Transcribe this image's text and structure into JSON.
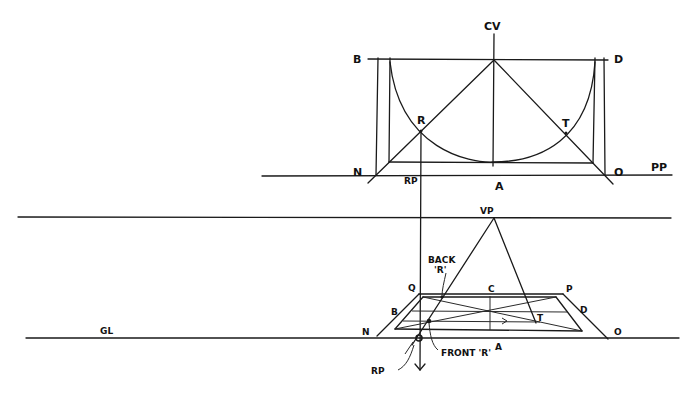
{
  "diagram": {
    "plan_view": {
      "labels": {
        "cv": "CV",
        "b": "B",
        "d": "D",
        "r": "R",
        "t": "T",
        "n": "N",
        "o": "O",
        "a": "A",
        "rp": "RP",
        "pp": "PP"
      }
    },
    "perspective_view": {
      "labels": {
        "vp": "VP",
        "back_r": "BACK",
        "back_r2": "'R'",
        "q": "Q",
        "c": "C",
        "p": "P",
        "b": "B",
        "d": "D",
        "t": "T",
        "n": "N",
        "o": "O",
        "a": "A",
        "front_r": "FRONT 'R'",
        "rp": "RP",
        "gl": "GL"
      }
    },
    "colors": {
      "ink": "#1a1a1a",
      "paper": "#ffffff"
    }
  }
}
